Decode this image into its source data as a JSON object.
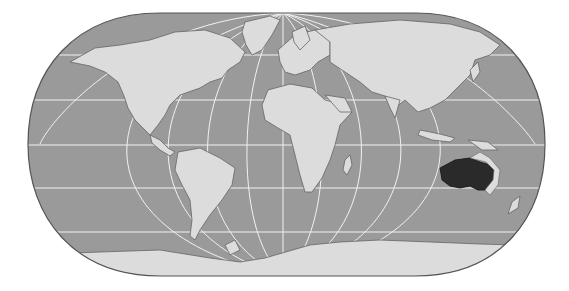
{
  "map": {
    "title": "World map (Eckert-style pseudocylindrical projection) with Australia highlighted",
    "projection": "pseudocylindrical, flat poles",
    "highlighted_region": "Australia",
    "colors": {
      "ocean": "#9a9a9a",
      "land": "#dcdcdc",
      "highlight": "#2a2a2a",
      "graticule": "#f2f2f2",
      "outline": "#555555",
      "coast": "#666666"
    },
    "graticule": {
      "parallels_y": [
        55,
        100,
        145,
        188,
        232
      ],
      "meridian_count": 12
    },
    "labels": []
  }
}
